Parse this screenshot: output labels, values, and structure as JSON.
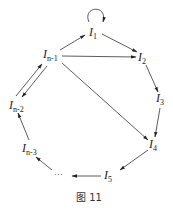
{
  "diagram": {
    "type": "directed-graph",
    "nodes": [
      {
        "id": "I1",
        "base": "I",
        "sub": "1",
        "x": 91,
        "y": 35
      },
      {
        "id": "I2",
        "base": "I",
        "sub": "2",
        "x": 139,
        "y": 61
      },
      {
        "id": "I3",
        "base": "I",
        "sub": "3",
        "x": 156,
        "y": 102
      },
      {
        "id": "I4",
        "base": "I",
        "sub": "4",
        "x": 149,
        "y": 148
      },
      {
        "id": "I5",
        "base": "I",
        "sub": "5",
        "x": 105,
        "y": 179
      },
      {
        "id": "dots",
        "base": "···",
        "sub": "",
        "x": 56,
        "y": 177
      },
      {
        "id": "In-3",
        "base": "I",
        "sub": "n-3",
        "x": 26,
        "y": 152
      },
      {
        "id": "In-2",
        "base": "I",
        "sub": "n-2",
        "x": 14,
        "y": 109
      },
      {
        "id": "In-1",
        "base": "I",
        "sub": "n-1",
        "x": 43,
        "y": 58
      }
    ],
    "edges": [
      {
        "from": "I1",
        "to": "I1",
        "kind": "self-loop"
      },
      {
        "from": "In-1",
        "to": "I1"
      },
      {
        "from": "I1",
        "to": "I2"
      },
      {
        "from": "In-1",
        "to": "I2"
      },
      {
        "from": "I2",
        "to": "I3"
      },
      {
        "from": "I3",
        "to": "I4"
      },
      {
        "from": "In-1",
        "to": "I4"
      },
      {
        "from": "I4",
        "to": "I5"
      },
      {
        "from": "I5",
        "to": "dots"
      },
      {
        "from": "dots",
        "to": "In-3"
      },
      {
        "from": "In-3",
        "to": "In-2"
      },
      {
        "from": "In-2",
        "to": "In-1"
      },
      {
        "from": "In-1",
        "to": "In-2"
      }
    ],
    "caption": "图 11"
  }
}
